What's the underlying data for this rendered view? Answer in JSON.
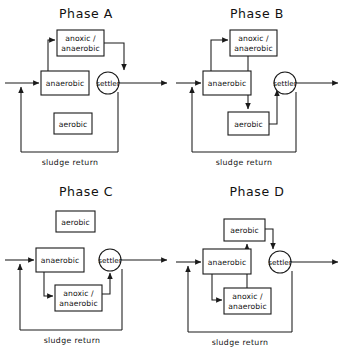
{
  "diagram": {
    "title_prefix": "Phase",
    "sludge_return_label": "sludge return",
    "settler_label": "settler",
    "reactor_labels": {
      "anoxic_anaerobic_line1": "anoxic /",
      "anoxic_anaerobic_line2": "anaerobic",
      "anaerobic": "anaerobic",
      "aerobic": "aerobic"
    },
    "line_color": "#1a1a1a",
    "background_color": "#ffffff"
  },
  "panels": [
    {
      "id": "phase-a",
      "title": "Phase A",
      "sludge_return_label": "sludge return",
      "settler_label": "settler",
      "boxes": [
        {
          "name": "anoxic-anaerobic",
          "line1": "anoxic /",
          "line2": "anaerobic",
          "x": 57,
          "y": 30,
          "w": 47,
          "h": 26
        },
        {
          "name": "anaerobic",
          "line1": "anaerobic",
          "line2": "",
          "x": 41,
          "y": 71,
          "w": 48,
          "h": 24
        },
        {
          "name": "aerobic",
          "line1": "aerobic",
          "line2": "",
          "x": 54,
          "y": 113,
          "w": 38,
          "h": 21
        }
      ],
      "settler": {
        "cx": 108,
        "cy": 83,
        "r": 11
      },
      "flow_order": [
        "influent",
        "anaerobic",
        "anoxic/anaerobic",
        "settler",
        "effluent"
      ],
      "active_reactors": [
        "anoxic / anaerobic",
        "anaerobic"
      ],
      "idle_reactors": [
        "aerobic"
      ]
    },
    {
      "id": "phase-b",
      "title": "Phase B",
      "sludge_return_label": "sludge return",
      "settler_label": "settler",
      "boxes": [
        {
          "name": "anoxic-anaerobic",
          "line1": "anoxic /",
          "line2": "anaerobic",
          "x": 230,
          "y": 30,
          "w": 47,
          "h": 26
        },
        {
          "name": "anaerobic",
          "line1": "anaerobic",
          "line2": "",
          "x": 203,
          "y": 71,
          "w": 48,
          "h": 24
        },
        {
          "name": "aerobic",
          "line1": "aerobic",
          "line2": "",
          "x": 228,
          "y": 112,
          "w": 41,
          "h": 23
        }
      ],
      "settler": {
        "cx": 285,
        "cy": 83,
        "r": 11
      },
      "flow_order": [
        "influent",
        "anaerobic",
        "anoxic/anaerobic",
        "aerobic",
        "settler",
        "effluent"
      ],
      "active_reactors": [
        "anoxic / anaerobic",
        "anaerobic",
        "aerobic"
      ],
      "idle_reactors": []
    },
    {
      "id": "phase-c",
      "title": "Phase C",
      "sludge_return_label": "sludge return",
      "settler_label": "settler",
      "boxes": [
        {
          "name": "aerobic",
          "line1": "aerobic",
          "line2": "",
          "x": 56,
          "y": 211,
          "w": 39,
          "h": 21
        },
        {
          "name": "anaerobic",
          "line1": "anaerobic",
          "line2": "",
          "x": 36,
          "y": 248,
          "w": 48,
          "h": 24
        },
        {
          "name": "anoxic-anaerobic",
          "line1": "anoxic /",
          "line2": "anaerobic",
          "x": 55,
          "y": 285,
          "w": 47,
          "h": 26
        }
      ],
      "settler": {
        "cx": 110,
        "cy": 260,
        "r": 11
      },
      "flow_order": [
        "influent",
        "anaerobic",
        "anoxic/anaerobic",
        "settler",
        "effluent"
      ],
      "active_reactors": [
        "anaerobic",
        "anoxic / anaerobic"
      ],
      "idle_reactors": [
        "aerobic"
      ]
    },
    {
      "id": "phase-d",
      "title": "Phase D",
      "sludge_return_label": "sludge return",
      "settler_label": "settler",
      "boxes": [
        {
          "name": "aerobic",
          "line1": "aerobic",
          "line2": "",
          "x": 224,
          "y": 219,
          "w": 41,
          "h": 22
        },
        {
          "name": "anaerobic",
          "line1": "anaerobic",
          "line2": "",
          "x": 203,
          "y": 249,
          "w": 48,
          "h": 25
        },
        {
          "name": "anoxic-anaerobic",
          "line1": "anoxic /",
          "line2": "anaerobic",
          "x": 224,
          "y": 288,
          "w": 47,
          "h": 26
        }
      ],
      "settler": {
        "cx": 280,
        "cy": 262,
        "r": 11
      },
      "flow_order": [
        "influent",
        "anaerobic",
        "anoxic/anaerobic",
        "aerobic",
        "settler",
        "effluent"
      ],
      "active_reactors": [
        "aerobic",
        "anaerobic",
        "anoxic / anaerobic"
      ],
      "idle_reactors": []
    }
  ]
}
